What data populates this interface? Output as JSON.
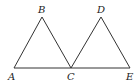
{
  "diagram": {
    "type": "geometry",
    "points": {
      "A": {
        "label": "A",
        "x": 14,
        "y": 68,
        "lx": 8,
        "ly": 80
      },
      "B": {
        "label": "B",
        "x": 42,
        "y": 17,
        "lx": 38,
        "ly": 13
      },
      "C": {
        "label": "C",
        "x": 71,
        "y": 68,
        "lx": 67,
        "ly": 80
      },
      "D": {
        "label": "D",
        "x": 101,
        "y": 17,
        "lx": 97,
        "ly": 13
      },
      "E": {
        "label": "E",
        "x": 130,
        "y": 68,
        "lx": 126,
        "ly": 80
      }
    },
    "segments": [
      [
        "A",
        "B"
      ],
      [
        "B",
        "C"
      ],
      [
        "C",
        "D"
      ],
      [
        "D",
        "E"
      ],
      [
        "A",
        "E"
      ]
    ],
    "stroke_color": "#333333"
  }
}
